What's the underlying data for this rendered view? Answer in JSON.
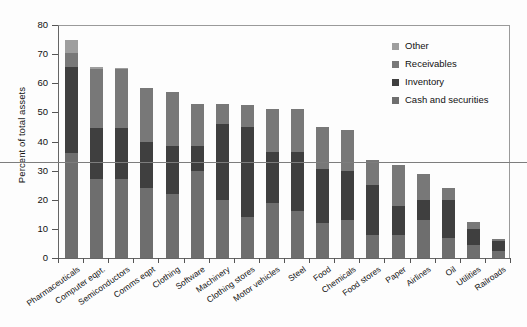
{
  "chart_data": {
    "type": "bar",
    "subtype": "stacked-bar",
    "title": "",
    "xlabel": "",
    "ylabel": "Percent of total assets",
    "ylim": [
      0,
      80
    ],
    "yticks": [
      0,
      10,
      20,
      30,
      40,
      50,
      60,
      70,
      80
    ],
    "grid": false,
    "legend_position": "top-right",
    "reference_line": {
      "value": 33,
      "label": ""
    },
    "categories": [
      "Pharmaceuticals",
      "Computer eqpt.",
      "Semiconductors",
      "Comms eqpt",
      "Clothing",
      "Software",
      "Machinery",
      "Clothing stores",
      "Motor vehicles",
      "Steel",
      "Food",
      "Chemicals",
      "Food stores",
      "Paper",
      "Airlines",
      "Oil",
      "Utilities",
      "Railroads"
    ],
    "series": [
      {
        "name": "Cash and securities",
        "color": "#6e6e6e",
        "values": [
          36.0,
          27.0,
          27.0,
          24.0,
          22.0,
          30.0,
          20.0,
          14.0,
          19.0,
          16.0,
          12.0,
          13.0,
          8.0,
          8.0,
          13.0,
          7.0,
          4.5,
          2.5
        ]
      },
      {
        "name": "Inventory",
        "color": "#3f3f3f",
        "values": [
          29.5,
          17.5,
          17.5,
          16.0,
          16.5,
          8.5,
          26.0,
          31.0,
          17.5,
          20.5,
          18.5,
          17.0,
          17.0,
          10.0,
          7.0,
          13.0,
          5.5,
          3.5
        ]
      },
      {
        "name": "Receivables",
        "color": "#787878",
        "values": [
          5.0,
          20.5,
          20.5,
          18.5,
          18.5,
          14.5,
          7.0,
          7.5,
          14.5,
          14.5,
          14.5,
          14.0,
          8.5,
          14.0,
          9.0,
          4.0,
          2.5,
          0.5
        ]
      },
      {
        "name": "Other",
        "color": "#9e9e9e",
        "values": [
          4.5,
          0.5,
          0.2,
          0.0,
          0.0,
          0.0,
          0.0,
          0.0,
          0.0,
          0.0,
          0.0,
          0.0,
          0.0,
          0.0,
          0.0,
          0.0,
          0.0,
          0.0
        ]
      }
    ],
    "totals": [
      75.0,
      65.5,
      65.2,
      58.5,
      57.0,
      53.0,
      53.0,
      52.5,
      51.0,
      51.0,
      45.0,
      44.0,
      33.5,
      32.0,
      29.0,
      24.0,
      12.5,
      6.5
    ]
  },
  "legend": {
    "items": [
      {
        "label": "Other",
        "color": "#9e9e9e"
      },
      {
        "label": "Receivables",
        "color": "#787878"
      },
      {
        "label": "Inventory",
        "color": "#3f3f3f"
      },
      {
        "label": "Cash and securities",
        "color": "#6e6e6e"
      }
    ]
  },
  "axis": {
    "y_title": "Percent of total assets",
    "y_ticks": [
      "80",
      "70",
      "60",
      "50",
      "40",
      "30",
      "20",
      "10",
      "0"
    ]
  }
}
